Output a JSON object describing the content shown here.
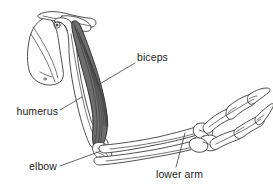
{
  "figure": {
    "background_color": "#ffffff",
    "line_color": "#30302f",
    "muscle_color": "#6e6e6e",
    "muscle_stroke_color": "#26262a"
  },
  "labels": [
    {
      "id": "biceps",
      "text": "biceps",
      "x": 137,
      "y": 61,
      "align": "start",
      "leader": "M 135 63 L 98 85"
    },
    {
      "id": "humerus",
      "text": "humerus",
      "x": 58,
      "y": 115,
      "align": "end",
      "leader": "M 60 110 L 82 97"
    },
    {
      "id": "elbow",
      "text": "elbow",
      "x": 57,
      "y": 170,
      "align": "end",
      "leader": "M 60 166 L 101 151"
    },
    {
      "id": "lower-arm",
      "text": "lower arm",
      "x": 156,
      "y": 178,
      "align": "start",
      "leader": "M 176 167 L 185 133"
    }
  ],
  "parts": {
    "scapula": "shoulder blade outline",
    "clavicle": "collarbone outline",
    "humerus": "upper arm bone",
    "biceps": "biceps brachii muscle, shaded gray with striations",
    "elbow": "elbow joint",
    "radius": "lower arm bone, upper",
    "ulna": "lower arm bone, lower",
    "carpals": "wrist bones",
    "digits": "two clawed digits"
  }
}
